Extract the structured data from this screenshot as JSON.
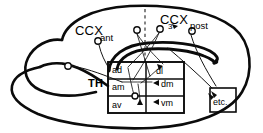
{
  "figure": {
    "background_color": "#ffffff",
    "ink_color": "#0b0b0b",
    "width": 263,
    "height": 133
  },
  "labels": {
    "cortex_main": "CCX",
    "cortex_anterior": "ant",
    "cortex_posterior_main": "CCX",
    "cortex_posterior_sub": "post",
    "thalamus": "TH",
    "marker_number": "3",
    "etc_box": "etc."
  },
  "thalamus_grid": {
    "name": "TH",
    "columns": 2,
    "rows": 3,
    "cells": [
      {
        "row": 0,
        "col": 0,
        "label": "ad"
      },
      {
        "row": 0,
        "col": 1,
        "label": "dl"
      },
      {
        "row": 1,
        "col": 0,
        "label": "am"
      },
      {
        "row": 1,
        "col": 1,
        "label": "dm"
      },
      {
        "row": 2,
        "col": 0,
        "label": "av"
      },
      {
        "row": 2,
        "col": 1,
        "label": "vm"
      }
    ]
  },
  "terminals": [
    {
      "id": "t-left-outer",
      "x": 68,
      "y": 66
    },
    {
      "id": "t-ant",
      "x": 98,
      "y": 41
    },
    {
      "id": "t-mid-left",
      "x": 137,
      "y": 30
    },
    {
      "id": "t-mid-right",
      "x": 160,
      "y": 29
    },
    {
      "id": "t-post-right",
      "x": 192,
      "y": 31
    },
    {
      "id": "t-grid-inner",
      "x": 135,
      "y": 97
    }
  ],
  "annotations": {
    "midline_is_dashed": true,
    "etc_box_has_incoming_arrows": true,
    "cells_with_arrowheads": [
      "dl",
      "dm",
      "vm"
    ]
  }
}
